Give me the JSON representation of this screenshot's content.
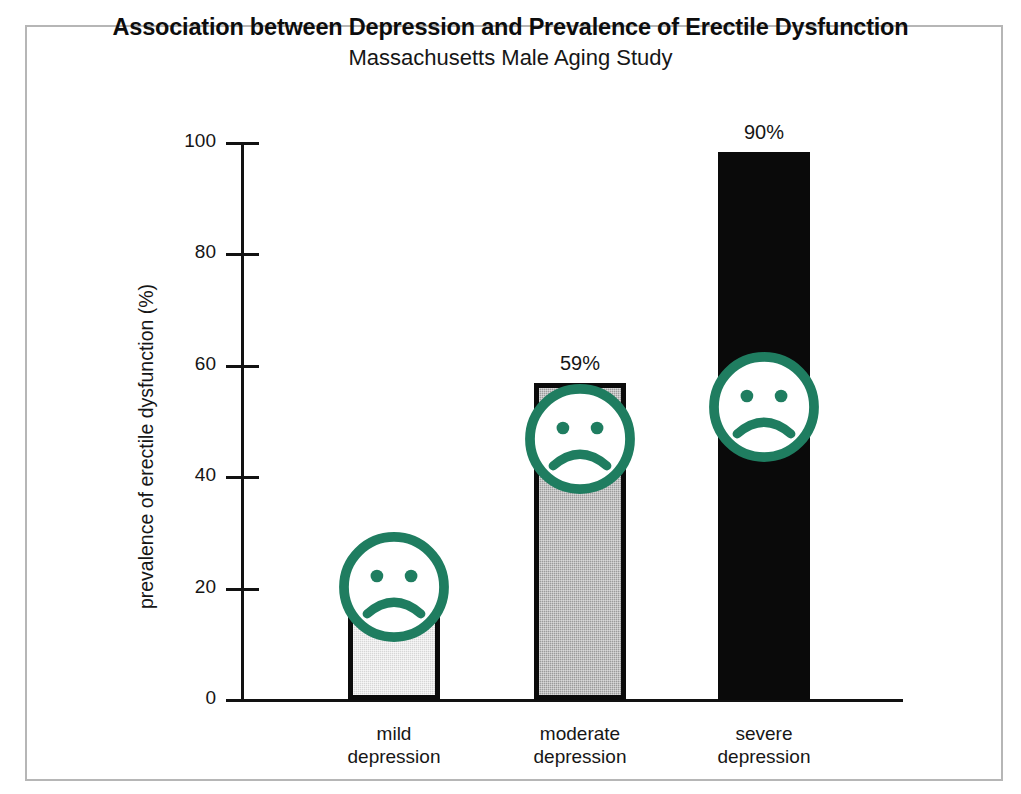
{
  "figure": {
    "title": "Association between Depression and Prevalence of Erectile Dysfunction",
    "subtitle": "Massachusetts Male Aging Study"
  },
  "chart_data": {
    "type": "bar",
    "title": "Association between Depression and Prevalence of Erectile Dysfunction",
    "subtitle": "Massachusetts Male Aging Study",
    "xlabel": "",
    "ylabel": "prevalence of erectile dysfunction (%)",
    "ylim": [
      0,
      100
    ],
    "yticks": [
      0,
      20,
      40,
      60,
      80,
      100
    ],
    "ytick_labels": [
      "0",
      "20",
      "40",
      "60",
      "80",
      "100"
    ],
    "grid": false,
    "legend": "none",
    "categories": [
      "mild depression",
      "moderate depression",
      "severe depression"
    ],
    "category_lines": [
      [
        "mild",
        "depression"
      ],
      [
        "moderate",
        "depression"
      ],
      [
        "severe",
        "depression"
      ]
    ],
    "values": [
      25,
      59,
      90
    ],
    "value_labels": [
      "25%",
      "59%",
      "90%"
    ],
    "drawn_heights_pct": [
      24.6,
      56.9,
      98.4
    ],
    "bar_fills": [
      "light-gray-dither",
      "medium-gray-dither",
      "solid-black"
    ],
    "bar_fill_colors": [
      "#d6d6d6",
      "#9b9b9b",
      "#0a0a0a"
    ],
    "bar_edge_color": "#0b0b0b",
    "icon": "sad-face-icon",
    "icon_color": "#1f7d60",
    "icons_per_bar": [
      "sad-face-icon",
      "sad-face-icon",
      "sad-face-icon"
    ]
  },
  "colors": {
    "accent_teal": "#1f7d60",
    "axis": "#121212",
    "frame": "#b6b6b6",
    "background": "#ffffff"
  }
}
